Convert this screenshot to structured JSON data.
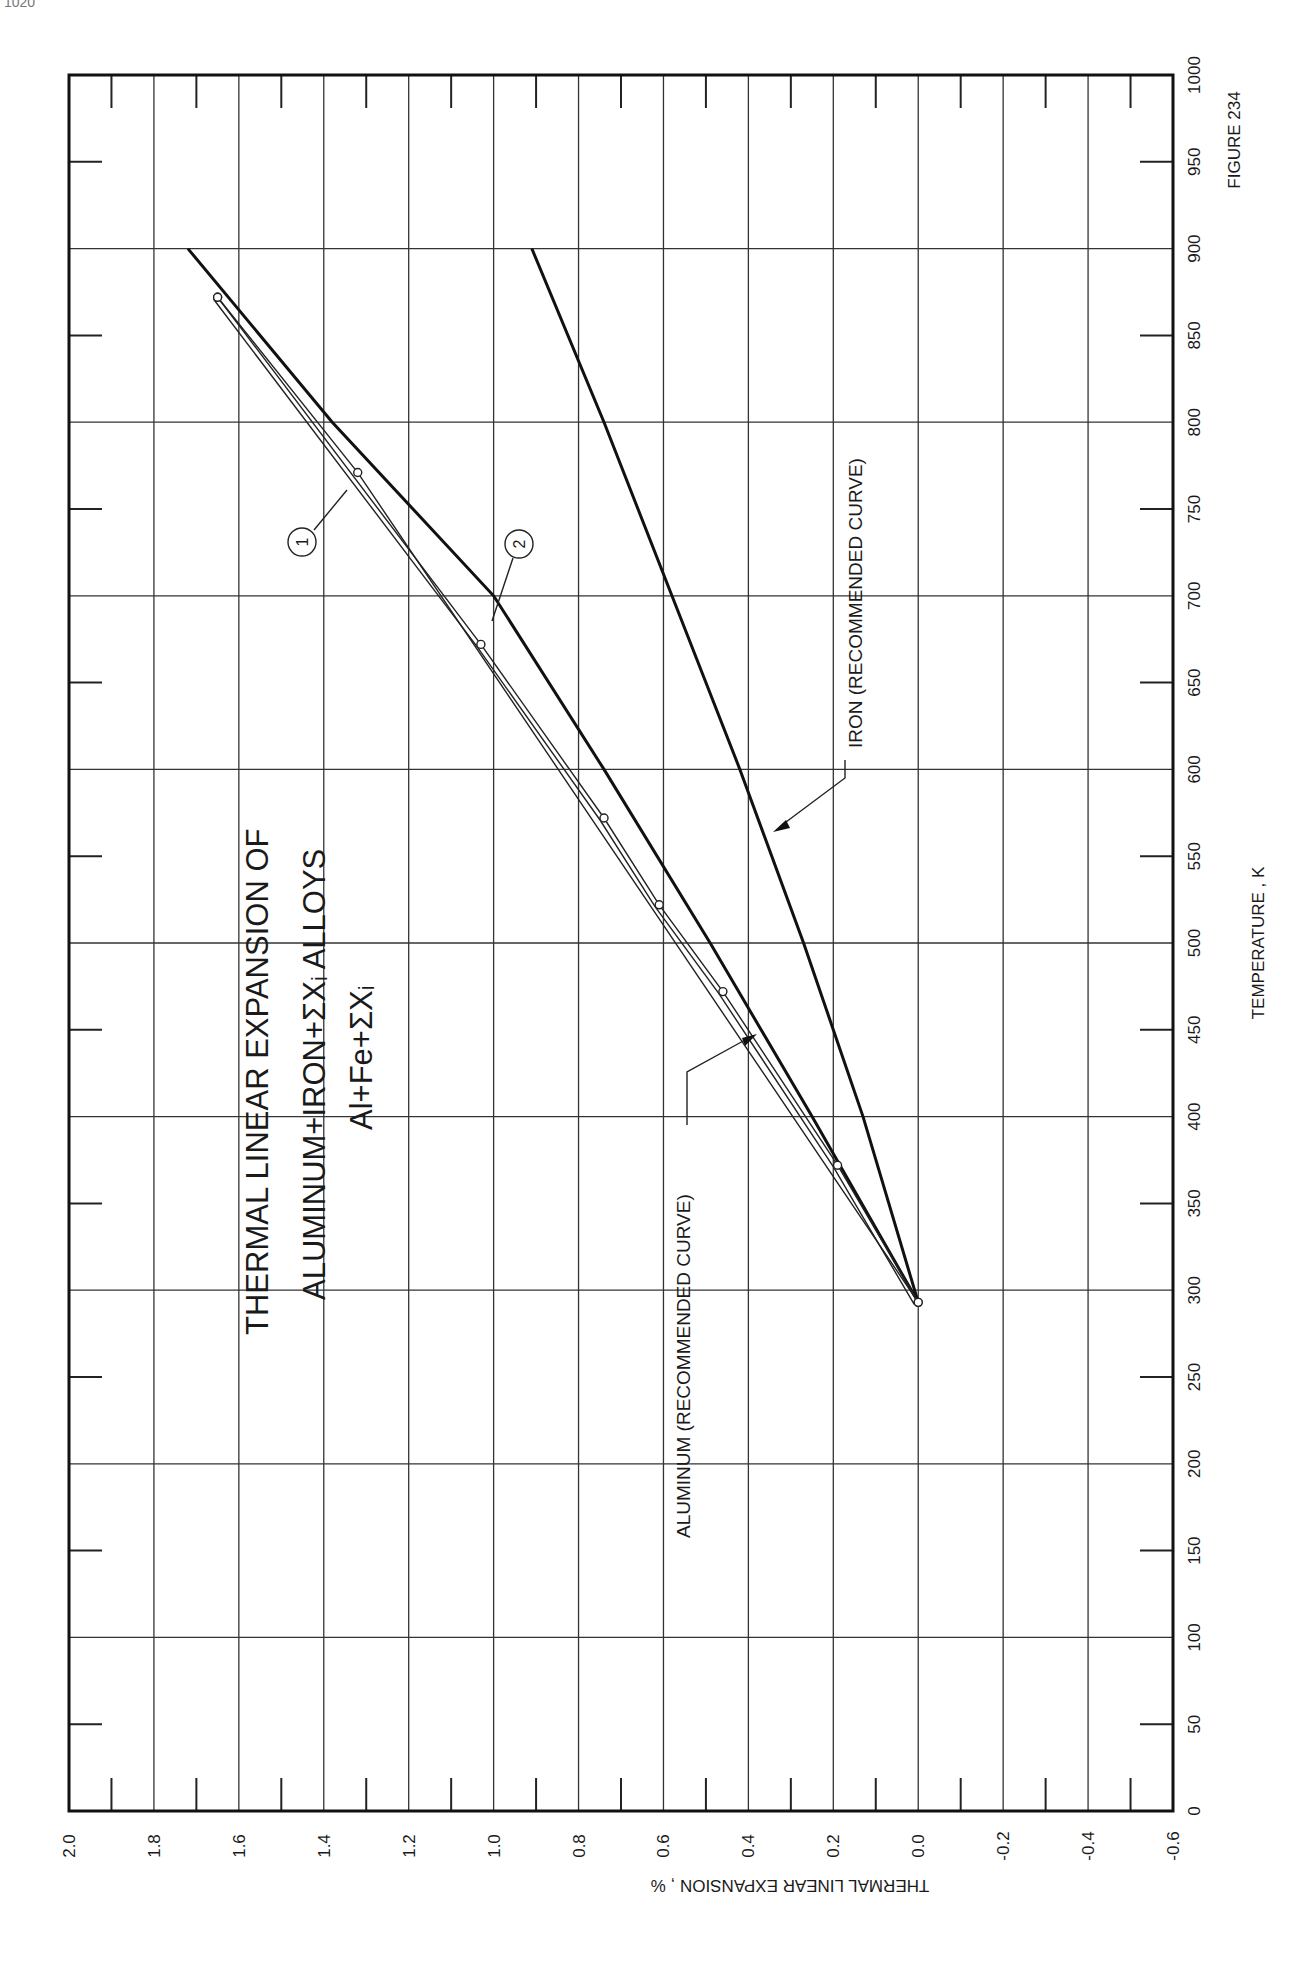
{
  "page": {
    "number": "1020"
  },
  "figure": {
    "label": "FIGURE 234",
    "title_line1": "THERMAL  LINEAR  EXPANSION  OF",
    "title_line2": "ALUMINUM+IRON+ΣXᵢ  ALLOYS",
    "title_line3": "Al+Fe+ΣXᵢ"
  },
  "axes": {
    "x_label": "TEMPERATURE , K",
    "y_label": "THERMAL  LINEAR  EXPANSION , %",
    "x_ticks": [
      "0",
      "50",
      "100",
      "150",
      "200",
      "250",
      "300",
      "350",
      "400",
      "450",
      "500",
      "550",
      "600",
      "650",
      "700",
      "750",
      "800",
      "850",
      "900",
      "950",
      "1000"
    ],
    "y_ticks": [
      "2.0",
      "1.8",
      "1.6",
      "1.4",
      "1.2",
      "1.0",
      "0.8",
      "0.6",
      "0.4",
      "0.2",
      "0.0",
      "-0.2",
      "-0.4",
      "-0.6"
    ]
  },
  "annotations": {
    "aluminum": "ALUMINUM (RECOMMENDED CURVE)",
    "iron": "IRON (RECOMMENDED CURVE)",
    "curve1": "1",
    "curve2": "2"
  },
  "chart_data": {
    "type": "line",
    "xlabel": "TEMPERATURE , K",
    "ylabel": "THERMAL LINEAR EXPANSION , %",
    "xlim": [
      0,
      1000
    ],
    "ylim": [
      -0.6,
      2.0
    ],
    "grid": true,
    "orientation": "rotated 90° (temperature axis vertical, expansion axis horizontal)",
    "figure_label": "FIGURE 234",
    "series": [
      {
        "name": "ALUMINUM (RECOMMENDED CURVE)",
        "style": "heavy line",
        "x": [
          293,
          400,
          500,
          600,
          700,
          800,
          900
        ],
        "y": [
          0.0,
          0.25,
          0.49,
          0.74,
          1.0,
          1.38,
          1.72
        ]
      },
      {
        "name": "IRON (RECOMMENDED CURVE)",
        "style": "heavy line",
        "x": [
          293,
          400,
          500,
          600,
          700,
          800,
          900
        ],
        "y": [
          0.0,
          0.13,
          0.27,
          0.42,
          0.58,
          0.74,
          0.91
        ]
      },
      {
        "name": "1",
        "style": "thin line, open markers",
        "x": [
          293,
          771,
          872
        ],
        "y": [
          0.0,
          1.32,
          1.65
        ]
      },
      {
        "name": "2",
        "style": "double thin line, open markers",
        "x": [
          293,
          372,
          472,
          522,
          572,
          672,
          872
        ],
        "y": [
          0.0,
          0.19,
          0.46,
          0.61,
          0.74,
          1.03,
          1.65
        ]
      }
    ]
  }
}
